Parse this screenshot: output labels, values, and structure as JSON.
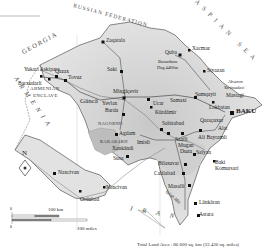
{
  "map": {
    "title": "Azerbaijan",
    "colors": {
      "land": "#d9d9d9",
      "land_light": "#ececec",
      "water": "#ffffff",
      "border": "#555555",
      "road": "#444444",
      "city": "#111111"
    },
    "countries": {
      "russia": "RUSSIAN FEDERATION",
      "georgia": "GEORGIA",
      "armenia": "ARMENIA",
      "iran": "IRAN",
      "caspian": "CASPIAN SEA"
    },
    "regions": {
      "armenian_enclave_line1": "ARMENIAN",
      "armenian_enclave_line2": "ENCLAVE",
      "nagorno": "NAGORNO",
      "karabakh": "KARABAKH",
      "mugan_line1": "Mugan",
      "mugan_line2": "Duzu"
    },
    "cities": {
      "baku": "BAKU",
      "zaqatala": "Zaqatala",
      "saki": "Saki",
      "quba": "Quba",
      "xacmaz": "Xacmaz",
      "siyazan": "Siyazan",
      "sumqayit": "Sumqayit",
      "lokbatan": "Lokbatan",
      "qazax": "Qazax",
      "tovuz": "Tovuz",
      "ganca": "Gäncä",
      "yevlax": "Yevlax",
      "barda": "Barda",
      "mingacevir": "Mingäçevir",
      "ucar": "Ucar",
      "kurdamir": "Kürdämir",
      "samaxi": "Samaxi",
      "sabirabad": "Sabirabad",
      "agdam": "Agdam",
      "xankandi": "Xankändi",
      "susa": "Susa",
      "imisli": "Imisli",
      "saatli": "Saatli",
      "ali_bayramli": "Ali Bayramli",
      "salyan": "Salyan",
      "alat": "Alat",
      "bilasuvar": "Bilasuvar",
      "calilabad": "Calilabad",
      "masalli": "Masalli",
      "lankaran": "Länkäran",
      "astara": "Astara",
      "naxcivan": "Naxcivan",
      "ordubad": "Ordubad",
      "mincivan": "Mincivan",
      "yukari_askipara": "Yukari Askipara",
      "barxudarli": "Barxudarli",
      "mastaga": "Mastagi",
      "qaracuxur": "Qaraçuxur"
    },
    "features": {
      "bazarduzu_line1": "Bazarduzu",
      "bazarduzu_line2": "Dag 4466m",
      "absheron_line1": "Abseron",
      "absheron_line2": "Yarimadasi",
      "baki_line1": "Baki",
      "baki_line2": "Komursari",
      "talish": "Talish Mts",
      "alazan": "Alazan",
      "kura": "Kur",
      "aras": "Araz"
    },
    "compass": {
      "north_label": "N"
    },
    "scale": {
      "km_zero": "0",
      "km_label": "100 km",
      "mi_zero": "0",
      "mi_label": "100 miles"
    },
    "footer": {
      "land_area": "Total Land Area : 86 600 sq. km (33 436 sq. miles)"
    }
  }
}
